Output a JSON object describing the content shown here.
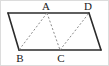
{
  "figure": {
    "type": "geometry-diagram",
    "canvas": {
      "width": 109,
      "height": 66
    },
    "background_color": "#ffffff",
    "border_color": "#dcdcdc",
    "stroke_color": "#2b2b2b",
    "dashed_color": "#8a8a8a",
    "solid_stroke_width": 1.6,
    "dashed_stroke_width": 1.0,
    "dash_pattern": "2,2",
    "vertices": [
      {
        "id": "P",
        "label": "",
        "x": 8,
        "y": 13,
        "label_x": 8,
        "label_y": 13,
        "labeled": false
      },
      {
        "id": "A",
        "label": "A",
        "x": 47,
        "y": 13,
        "label_x": 46,
        "label_y": 1,
        "labeled": true
      },
      {
        "id": "D",
        "label": "D",
        "x": 89,
        "y": 13,
        "label_x": 88,
        "label_y": 1,
        "labeled": true
      },
      {
        "id": "Q",
        "label": "",
        "x": 101,
        "y": 50,
        "label_x": 101,
        "label_y": 50,
        "labeled": false
      },
      {
        "id": "C",
        "label": "C",
        "x": 60,
        "y": 50,
        "label_x": 61,
        "label_y": 52,
        "labeled": true
      },
      {
        "id": "B",
        "label": "B",
        "x": 19,
        "y": 50,
        "label_x": 20,
        "label_y": 52,
        "labeled": true
      }
    ],
    "solid_edges": [
      {
        "name": "top-edge",
        "from": "P",
        "to": "D",
        "points": "8,13 89,13"
      },
      {
        "name": "right-edge",
        "from": "D",
        "to": "Q",
        "points": "89,13 101,50"
      },
      {
        "name": "bottom-edge",
        "from": "Q",
        "to": "B",
        "points": "101,50 19,50"
      },
      {
        "name": "left-edge",
        "from": "B",
        "to": "P",
        "points": "19,50 8,13"
      }
    ],
    "dashed_edges": [
      {
        "name": "segment-AB",
        "from": "A",
        "to": "B",
        "points": "47,13 19,50"
      },
      {
        "name": "segment-AC",
        "from": "A",
        "to": "C",
        "points": "47,13 60,50"
      },
      {
        "name": "segment-CD",
        "from": "C",
        "to": "D",
        "points": "60,50 89,13"
      }
    ],
    "labels": [
      {
        "text": "A",
        "x": 46,
        "y": 1
      },
      {
        "text": "D",
        "x": 88,
        "y": 1
      },
      {
        "text": "B",
        "x": 20,
        "y": 52
      },
      {
        "text": "C",
        "x": 61,
        "y": 52
      }
    ]
  }
}
